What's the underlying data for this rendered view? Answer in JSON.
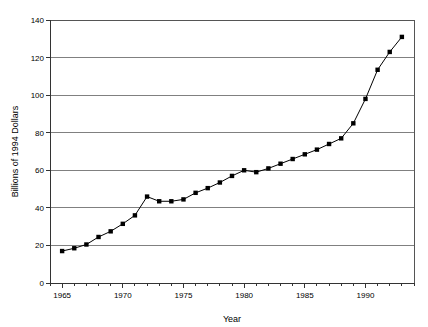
{
  "chart_data": {
    "type": "line",
    "title": "",
    "xlabel": "Year",
    "ylabel": "Billions of 1994 Dollars",
    "xlim": [
      1964,
      1994
    ],
    "ylim": [
      0,
      140
    ],
    "xticks": [
      1965,
      1970,
      1975,
      1980,
      1985,
      1990
    ],
    "xtick_labels": [
      "1965",
      "1970",
      "1975",
      "1980",
      "1985",
      "1990"
    ],
    "yticks": [
      0,
      20,
      40,
      60,
      80,
      100,
      120,
      140
    ],
    "ytick_labels": [
      "0",
      "20",
      "40",
      "60",
      "80",
      "100",
      "120",
      "140"
    ],
    "minor_xticks_interval": 1,
    "grid": "horizontal",
    "legend": "none",
    "marker": "square",
    "marker_color": "#000000",
    "line_color": "#000000",
    "x": [
      1965,
      1966,
      1967,
      1968,
      1969,
      1970,
      1971,
      1972,
      1973,
      1974,
      1975,
      1976,
      1977,
      1978,
      1979,
      1980,
      1981,
      1982,
      1983,
      1984,
      1985,
      1986,
      1987,
      1988,
      1989,
      1990,
      1991,
      1992,
      1993
    ],
    "values": [
      17,
      18.5,
      20.5,
      24.5,
      27.5,
      31.5,
      36,
      46,
      43.5,
      43.5,
      44.5,
      48,
      50.5,
      53.5,
      57,
      60,
      59,
      61,
      63.5,
      66,
      68.5,
      71,
      74,
      77,
      85,
      98,
      113.5,
      123,
      131
    ],
    "series": [
      {
        "name": "Spending",
        "values": [
          17,
          18.5,
          20.5,
          24.5,
          27.5,
          31.5,
          36,
          46,
          43.5,
          43.5,
          44.5,
          48,
          50.5,
          53.5,
          57,
          60,
          59,
          61,
          63.5,
          66,
          68.5,
          71,
          74,
          77,
          85,
          98,
          113.5,
          123,
          131
        ]
      }
    ]
  }
}
